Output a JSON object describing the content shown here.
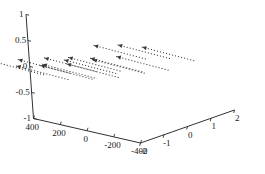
{
  "figure": {
    "type": "3d-quiver-plot",
    "background": "#ffffff",
    "axis_color": "#1a1a1a",
    "data_color": "#3a3a3a"
  },
  "chart_data": {
    "type": "scatter",
    "subtype": "3d-quiver-vector-field",
    "title": "",
    "xlabel": "",
    "ylabel": "",
    "zlabel": "",
    "grid": false,
    "legend": null,
    "projection": "3d",
    "axes": {
      "x": {
        "name": "x-axis",
        "ticks": [
          -2,
          -1,
          0,
          1,
          2
        ],
        "tick_labels": [
          "-2",
          "-1",
          "0",
          "1",
          "2"
        ],
        "lim": [
          -2,
          2
        ],
        "direction": "right-receding"
      },
      "y": {
        "name": "y-axis",
        "ticks": [
          400,
          200,
          0,
          -200,
          -400
        ],
        "tick_labels": [
          "400",
          "200",
          "0",
          "-200",
          "-400"
        ],
        "lim": [
          -400,
          400
        ],
        "direction": "left-receding"
      },
      "z": {
        "name": "z-axis",
        "ticks": [
          1,
          0.5,
          0,
          -0.5,
          -1
        ],
        "tick_labels": [
          "1",
          "0.5",
          "0",
          "-0.5",
          "-1"
        ],
        "lim": [
          -1,
          1
        ],
        "direction": "vertical"
      }
    },
    "marker": "dotted",
    "arrow_style": "filled-head",
    "vectors": [
      {
        "x": -2.0,
        "y": 300,
        "z": -0.1,
        "dx": -1.0,
        "dy": 200,
        "dz": 0.3
      },
      {
        "x": -1.0,
        "y": 300,
        "z": -0.35,
        "dx": -1.0,
        "dy": 200,
        "dz": 0.3
      },
      {
        "x": 0.0,
        "y": 300,
        "z": -0.5,
        "dx": -1.0,
        "dy": 200,
        "dz": 0.3
      },
      {
        "x": 1.0,
        "y": 300,
        "z": -0.55,
        "dx": -1.0,
        "dy": 200,
        "dz": 0.3
      },
      {
        "x": -2.0,
        "y": 100,
        "z": 0.05,
        "dx": -1.0,
        "dy": 200,
        "dz": 0.3
      },
      {
        "x": -1.0,
        "y": 100,
        "z": -0.2,
        "dx": -1.0,
        "dy": 200,
        "dz": 0.3
      },
      {
        "x": 0.0,
        "y": 100,
        "z": -0.35,
        "dx": -1.0,
        "dy": 200,
        "dz": 0.3
      },
      {
        "x": 1.0,
        "y": 100,
        "z": -0.4,
        "dx": -1.0,
        "dy": 200,
        "dz": 0.3
      },
      {
        "x": -2.0,
        "y": -100,
        "z": 0.2,
        "dx": -1.0,
        "dy": 200,
        "dz": 0.3
      },
      {
        "x": -1.0,
        "y": -100,
        "z": 0.05,
        "dx": -1.0,
        "dy": 200,
        "dz": 0.3
      },
      {
        "x": 0.0,
        "y": -100,
        "z": -0.15,
        "dx": -1.0,
        "dy": 200,
        "dz": 0.3
      },
      {
        "x": 1.0,
        "y": -100,
        "z": -0.25,
        "dx": -1.0,
        "dy": 200,
        "dz": 0.3
      },
      {
        "x": -1.0,
        "y": -300,
        "z": 0.4,
        "dx": -1.0,
        "dy": 200,
        "dz": 0.3
      },
      {
        "x": 0.0,
        "y": -300,
        "z": 0.25,
        "dx": -1.0,
        "dy": 200,
        "dz": 0.3
      },
      {
        "x": 1.0,
        "y": -300,
        "z": 0.05,
        "dx": -1.0,
        "dy": 200,
        "dz": 0.3
      }
    ]
  },
  "zticks": [
    {
      "label": "1",
      "value": 1
    },
    {
      "label": "0.5",
      "value": 0.5
    },
    {
      "label": "0",
      "value": 0
    },
    {
      "label": "-0.5",
      "value": -0.5
    },
    {
      "label": "-1",
      "value": -1
    }
  ],
  "yticks": [
    {
      "label": "400",
      "value": 400
    },
    {
      "label": "200",
      "value": 200
    },
    {
      "label": "0",
      "value": 0
    },
    {
      "label": "-200",
      "value": -200
    },
    {
      "label": "-400",
      "value": -400
    }
  ],
  "xticks": [
    {
      "label": "-2",
      "value": -2
    },
    {
      "label": "-1",
      "value": -1
    },
    {
      "label": "0",
      "value": 0
    },
    {
      "label": "1",
      "value": 1
    },
    {
      "label": "2",
      "value": 2
    }
  ]
}
